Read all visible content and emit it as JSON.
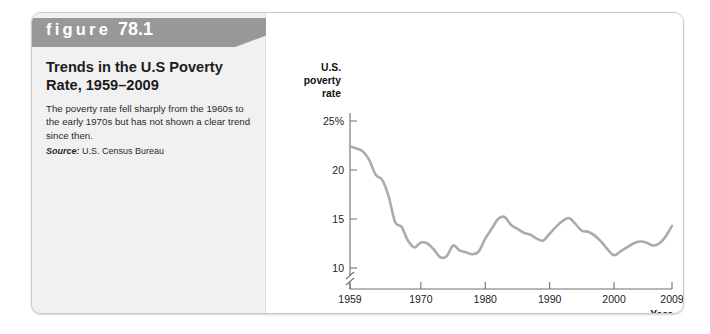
{
  "figure": {
    "banner_label": "figure",
    "banner_number": "78.1",
    "title": "Trends in the U.S Poverty Rate, 1959–2009",
    "description": "The poverty rate fell sharply from the 1960s to the early 1970s but has not shown a clear trend since then.",
    "source_label": "Source:",
    "source_value": "U.S. Census Bureau"
  },
  "colors": {
    "banner": "#989898",
    "panel": "#f1f1f1",
    "line": "#ababab",
    "axis": "#6f6f6f",
    "card_border": "#c9c9c9"
  },
  "chart_data": {
    "type": "line",
    "title": "Trends in the U.S Poverty Rate, 1959–2009",
    "xlabel": "Year",
    "ylabel": "U.S. poverty rate",
    "ylabel_lines": [
      "U.S.",
      "poverty",
      "rate"
    ],
    "grid": false,
    "legend": "none",
    "y_axis_break": true,
    "xlim": [
      1959,
      2009
    ],
    "ylim": [
      9,
      25
    ],
    "xticks": [
      1959,
      1970,
      1980,
      1990,
      2000,
      2009
    ],
    "xtick_labels": [
      "1959",
      "1970",
      "1980",
      "1990",
      "2000",
      "2009"
    ],
    "yticks": [
      10,
      15,
      20,
      25
    ],
    "ytick_labels": [
      "10",
      "15",
      "20",
      "25%"
    ],
    "series": [
      {
        "name": "U.S. poverty rate",
        "x": [
          1959,
          1960,
          1961,
          1962,
          1963,
          1964,
          1965,
          1966,
          1967,
          1968,
          1969,
          1970,
          1971,
          1972,
          1973,
          1974,
          1975,
          1976,
          1977,
          1978,
          1979,
          1980,
          1981,
          1982,
          1983,
          1984,
          1985,
          1986,
          1987,
          1988,
          1989,
          1990,
          1991,
          1992,
          1993,
          1994,
          1995,
          1996,
          1997,
          1998,
          1999,
          2000,
          2001,
          2002,
          2003,
          2004,
          2005,
          2006,
          2007,
          2008,
          2009
        ],
        "values": [
          22.4,
          22.2,
          21.9,
          21.0,
          19.5,
          19.0,
          17.3,
          14.7,
          14.2,
          12.8,
          12.1,
          12.6,
          12.5,
          11.9,
          11.1,
          11.2,
          12.3,
          11.8,
          11.6,
          11.4,
          11.7,
          13.0,
          14.0,
          15.0,
          15.2,
          14.4,
          14.0,
          13.6,
          13.4,
          13.0,
          12.8,
          13.5,
          14.2,
          14.8,
          15.1,
          14.5,
          13.8,
          13.7,
          13.3,
          12.7,
          11.9,
          11.3,
          11.7,
          12.1,
          12.5,
          12.7,
          12.6,
          12.3,
          12.5,
          13.2,
          14.3
        ]
      }
    ]
  }
}
